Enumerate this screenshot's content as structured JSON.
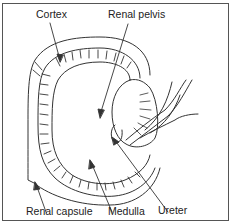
{
  "diagram": {
    "colors": {
      "line": "#333333",
      "border": "#555555",
      "background": "#ffffff"
    },
    "labels": {
      "cortex": "Cortex",
      "renal_pelvis": "Renal pelvis",
      "renal_capsule": "Renal capsule",
      "medulla": "Medulla",
      "ureter": "Ureter"
    }
  }
}
